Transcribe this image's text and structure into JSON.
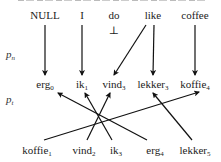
{
  "diagram": {
    "source_tokens": [
      "NULL",
      "I",
      "do",
      "like",
      "coffee"
    ],
    "side_labels": {
      "pn": {
        "base": "p",
        "sub": "n"
      },
      "pt": {
        "base": "p",
        "sub": "t"
      }
    },
    "middle_tokens": [
      {
        "word": "erg",
        "index": "0"
      },
      {
        "word": "ik",
        "index": "1"
      },
      {
        "word": "vind",
        "index": "3"
      },
      {
        "word": "lekker",
        "index": "3"
      },
      {
        "word": "koffie",
        "index": "4"
      }
    ],
    "bottom_tokens": [
      {
        "word": "koffie",
        "index": "1"
      },
      {
        "word": "vind",
        "index": "2"
      },
      {
        "word": "ik",
        "index": "3"
      },
      {
        "word": "erg",
        "index": "4"
      },
      {
        "word": "lekker",
        "index": "5"
      }
    ],
    "null_alignment_marker": "⊥",
    "pn_alignments": [
      {
        "from": "NULL",
        "to": "erg0"
      },
      {
        "from": "I",
        "to": "ik1"
      },
      {
        "from": "like",
        "to": "vind3"
      },
      {
        "from": "like",
        "to": "lekker3"
      },
      {
        "from": "coffee",
        "to": "koffie4"
      }
    ],
    "pt_alignments": [
      {
        "from": "koffie1",
        "to": "koffie4"
      },
      {
        "from": "vind2",
        "to": "vind3"
      },
      {
        "from": "ik3",
        "to": "ik1"
      },
      {
        "from": "erg4",
        "to": "erg0"
      },
      {
        "from": "lekker5",
        "to": "lekker3"
      }
    ]
  }
}
